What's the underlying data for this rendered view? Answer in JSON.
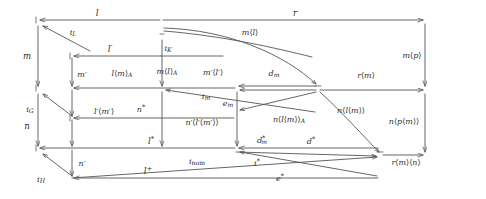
{
  "diagram": {
    "kind": "commutative-diagram",
    "background_color": "#ffffff",
    "stroke_color": "#555555",
    "text_color": "#2b2b2b",
    "nodes": [
      {
        "id": "n_tl",
        "x": 38,
        "y": 20,
        "name": "node-top-left"
      },
      {
        "id": "n_L",
        "x": 41,
        "y": 26,
        "name": "node-L"
      },
      {
        "id": "n_K",
        "x": 162,
        "y": 38,
        "name": "node-K"
      },
      {
        "id": "n_ktop",
        "x": 161,
        "y": 30,
        "name": "node-K-top"
      },
      {
        "id": "n_tr",
        "x": 425,
        "y": 20,
        "name": "node-top-right"
      },
      {
        "id": "n_mp2",
        "x": 72,
        "y": 56,
        "name": "node-mprime-top"
      },
      {
        "id": "n_c2",
        "x": 72,
        "y": 88,
        "name": "node-col2-mid"
      },
      {
        "id": "n_c1m",
        "x": 38,
        "y": 88,
        "name": "node-col1-mid"
      },
      {
        "id": "n_G",
        "x": 41,
        "y": 94,
        "name": "node-G"
      },
      {
        "id": "n_c3",
        "x": 237,
        "y": 88,
        "name": "node-col3-mid"
      },
      {
        "id": "n_cv",
        "x": 318,
        "y": 88,
        "name": "node-converge"
      },
      {
        "id": "n_mr",
        "x": 425,
        "y": 90,
        "name": "node-mid-right"
      },
      {
        "id": "n_c2b",
        "x": 72,
        "y": 118,
        "name": "node-col2-lower"
      },
      {
        "id": "n_c1b",
        "x": 38,
        "y": 148,
        "name": "node-col1-bottom"
      },
      {
        "id": "n_H",
        "x": 41,
        "y": 154,
        "name": "node-H"
      },
      {
        "id": "n_c2c",
        "x": 72,
        "y": 148,
        "name": "node-col2-bottom"
      },
      {
        "id": "n_c3b",
        "x": 237,
        "y": 148,
        "name": "node-col3-bottom"
      },
      {
        "id": "n_br",
        "x": 380,
        "y": 155,
        "name": "node-bottom-right"
      },
      {
        "id": "n_c2d",
        "x": 72,
        "y": 178,
        "name": "node-col2-last"
      },
      {
        "id": "n_brr",
        "x": 425,
        "y": 155,
        "name": "node-far-bottom-right"
      }
    ],
    "labels": [
      {
        "id": "l",
        "text": "l",
        "x": 97,
        "y": 13,
        "size": "s11",
        "name": "label-l"
      },
      {
        "id": "r",
        "text": "r",
        "x": 295,
        "y": 13,
        "size": "s11",
        "name": "label-r"
      },
      {
        "id": "iL",
        "text": "i_L",
        "x": 72,
        "y": 33,
        "size": "s10",
        "name": "label-i-L"
      },
      {
        "id": "iK",
        "text": "i_K",
        "x": 167,
        "y": 48,
        "size": "s10",
        "name": "label-i-K"
      },
      {
        "id": "ml",
        "text": "m<l>",
        "x": 250,
        "y": 33,
        "size": "s10",
        "name": "label-m-angle-l"
      },
      {
        "id": "m",
        "text": "m",
        "x": 27,
        "y": 56,
        "size": "s11",
        "name": "label-m"
      },
      {
        "id": "lprime",
        "text": "l'",
        "x": 110,
        "y": 49,
        "size": "s11",
        "name": "label-l-prime"
      },
      {
        "id": "mp",
        "text": "m<p>",
        "x": 411,
        "y": 56,
        "size": "s10",
        "name": "label-m-angle-p"
      },
      {
        "id": "mprime",
        "text": "m'",
        "x": 82,
        "y": 75,
        "size": "s10",
        "name": "label-m-prime"
      },
      {
        "id": "lmA",
        "text": "l<m>_A",
        "x": 122,
        "y": 74,
        "size": "s10",
        "name": "label-l-angle-m-A"
      },
      {
        "id": "mlA",
        "text": "m<l>_A",
        "x": 166,
        "y": 72,
        "size": "s10",
        "name": "label-m-angle-l-A"
      },
      {
        "id": "mplp",
        "text": "m'<l'>",
        "x": 212,
        "y": 73,
        "size": "s10",
        "name": "label-m-prime-angle-l-prime"
      },
      {
        "id": "dm",
        "text": "d_m",
        "x": 274,
        "y": 74,
        "size": "s10",
        "name": "label-d-m"
      },
      {
        "id": "rm",
        "text": "r<m>",
        "x": 366,
        "y": 76,
        "size": "s10",
        "name": "label-r-angle-m"
      },
      {
        "id": "iG",
        "text": "i_G",
        "x": 30,
        "y": 110,
        "size": "s10",
        "name": "label-i-G"
      },
      {
        "id": "im",
        "text": "i_m",
        "x": 205,
        "y": 97,
        "size": "s10",
        "name": "label-i-m"
      },
      {
        "id": "em",
        "text": "e_m",
        "x": 228,
        "y": 103,
        "size": "s10",
        "name": "label-e-m"
      },
      {
        "id": "nstar",
        "text": "n*",
        "x": 141,
        "y": 109,
        "size": "s10",
        "name": "label-n-star"
      },
      {
        "id": "nlm",
        "text": "n<l<m>>",
        "x": 350,
        "y": 111,
        "size": "s10",
        "name": "label-n-angle-l-angle-m"
      },
      {
        "id": "npm",
        "text": "n<p<m>>",
        "x": 403,
        "y": 122,
        "size": "s10",
        "name": "label-n-angle-p-angle-m"
      },
      {
        "id": "lpmp",
        "text": "l'<m'>",
        "x": 104,
        "y": 112,
        "size": "s10",
        "name": "label-l-prime-angle-m-prime"
      },
      {
        "id": "nplpmp",
        "text": "n'<l'<m'>>",
        "x": 201,
        "y": 123,
        "size": "s10",
        "name": "label-n-prime-angle-l-prime"
      },
      {
        "id": "nlmA",
        "text": "n<l<m>>_A",
        "x": 289,
        "y": 120,
        "size": "s10",
        "name": "label-n-angle-l-angle-m-A"
      },
      {
        "id": "n",
        "text": "n",
        "x": 27,
        "y": 126,
        "size": "s11",
        "name": "label-n"
      },
      {
        "id": "dmstar",
        "text": "d*_m",
        "x": 262,
        "y": 140,
        "size": "s10",
        "name": "label-d-m-star"
      },
      {
        "id": "dstar",
        "text": "d*",
        "x": 310,
        "y": 141,
        "size": "s10",
        "name": "label-d-star"
      },
      {
        "id": "lstar",
        "text": "l*",
        "x": 151,
        "y": 141,
        "size": "s11",
        "name": "label-l-star"
      },
      {
        "id": "nprime",
        "text": "n'",
        "x": 82,
        "y": 164,
        "size": "s10",
        "name": "label-n-prime"
      },
      {
        "id": "iH",
        "text": "i_H",
        "x": 41,
        "y": 180,
        "size": "s10",
        "name": "label-i-H"
      },
      {
        "id": "inom",
        "text": "i_nom",
        "x": 196,
        "y": 162,
        "size": "s10",
        "name": "label-i-nom"
      },
      {
        "id": "istar",
        "text": "i*",
        "x": 257,
        "y": 163,
        "size": "s10",
        "name": "label-i-star"
      },
      {
        "id": "lplus",
        "text": "l+",
        "x": 148,
        "y": 171,
        "size": "s11",
        "name": "label-l-plus"
      },
      {
        "id": "estar",
        "text": "e*",
        "x": 279,
        "y": 178,
        "size": "s10",
        "name": "label-e-star"
      },
      {
        "id": "rmn",
        "text": "r<m><n>",
        "x": 405,
        "y": 163,
        "size": "s10",
        "name": "label-r-angle-m-angle-n"
      }
    ],
    "edges": [
      {
        "from": "top-right-corner",
        "to": "top-left",
        "name": "edge-l-top"
      },
      {
        "from": "node-K",
        "to": "node-top-right",
        "name": "edge-r-top"
      },
      {
        "from": "node-L",
        "to": "node-iL-target",
        "name": "edge-i-L"
      },
      {
        "from": "node-K-top",
        "to": "node-ml-target",
        "name": "edge-m-angle-l"
      },
      {
        "from": "node-top-left",
        "to": "node-col1-mid",
        "name": "edge-m"
      },
      {
        "from": "node-K",
        "to": "node-mprime-top",
        "name": "edge-l-prime"
      },
      {
        "from": "node-top-right",
        "to": "node-mid-right",
        "name": "edge-m-angle-p"
      },
      {
        "from": "node-mprime-top",
        "to": "node-col2-mid",
        "name": "edge-m-prime"
      },
      {
        "from": "node-col3-mid",
        "to": "node-col2-mid",
        "name": "edge-l-angle-m-A"
      },
      {
        "from": "node-K",
        "to": "node-col3-mid",
        "name": "edge-m-angle-l-A"
      },
      {
        "from": "node-converge",
        "to": "node-col3-mid",
        "name": "edge-d-m"
      },
      {
        "from": "node-converge",
        "to": "node-mid-right",
        "name": "edge-r-angle-m"
      },
      {
        "from": "node-G",
        "to": "node-col2-lower",
        "name": "edge-i-G"
      },
      {
        "from": "node-col3-mid",
        "to": "node-col3-bottom",
        "name": "edge-n-angle-l-angle-m-A"
      },
      {
        "from": "node-col1-mid",
        "to": "node-col1-bottom",
        "name": "edge-n"
      },
      {
        "from": "node-col2-mid",
        "to": "node-col2-bottom",
        "name": "edge-n-star-col"
      },
      {
        "from": "node-converge",
        "to": "node-bottom-right",
        "name": "edge-n-angle-l-angle-m"
      },
      {
        "from": "node-mid-right",
        "to": "node-far-bottom-right",
        "name": "edge-n-angle-p-angle-m"
      },
      {
        "from": "node-col3-bottom",
        "to": "node-col2-bottom",
        "name": "edge-l-star"
      },
      {
        "from": "node-bottom-right",
        "to": "node-col3-bottom",
        "name": "edge-d-star"
      },
      {
        "from": "node-col2-bottom",
        "to": "node-col2-last",
        "name": "edge-n-prime"
      },
      {
        "from": "node-H",
        "to": "node-col2-last",
        "name": "edge-i-H"
      },
      {
        "from": "node-bottom-right",
        "to": "node-col2-last",
        "name": "edge-l-plus"
      },
      {
        "from": "node-col3-bottom",
        "to": "node-inom-src",
        "name": "edge-i-nom"
      },
      {
        "from": "node-bottom-right",
        "to": "node-far-bottom-right",
        "name": "edge-r-angle-m-angle-n"
      }
    ]
  }
}
